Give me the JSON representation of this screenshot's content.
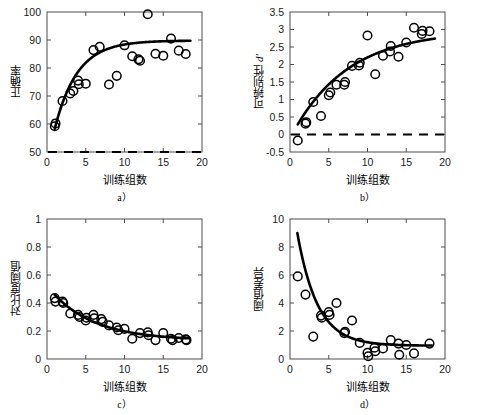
{
  "figure": {
    "xlabel": "训练组数",
    "panels": [
      {
        "id": "a",
        "caption": "a）",
        "ylabel_main": "正确率",
        "ylabel_italic": "",
        "chance_line": 50
      },
      {
        "id": "b",
        "caption": "b）",
        "ylabel_main": "可辨别性 ",
        "ylabel_italic": "d'",
        "chance_line": 0
      },
      {
        "id": "c",
        "caption": "c）",
        "ylabel_main": "对比度阈值",
        "ylabel_italic": "",
        "chance_line": null
      },
      {
        "id": "d",
        "caption": "d）",
        "ylabel_main": "阈值差异",
        "ylabel_italic": "",
        "chance_line": null
      }
    ]
  },
  "chart_data": [
    {
      "type": "scatter",
      "panel": "a",
      "title": "",
      "xlabel": "训练组数",
      "ylabel": "正确率",
      "xlim": [
        0,
        20
      ],
      "ylim": [
        50,
        100
      ],
      "xticks": [
        0,
        5,
        10,
        15,
        20
      ],
      "yticks": [
        50,
        60,
        70,
        80,
        90,
        100
      ],
      "grid": false,
      "legend": "none",
      "marker": "open-circle",
      "x": [
        1,
        1.1,
        2,
        3,
        3.4,
        4,
        4.1,
        5,
        6,
        6.8,
        8,
        9,
        10,
        11,
        11.8,
        12,
        13,
        14,
        15,
        16,
        17,
        17.9
      ],
      "y": [
        59.2,
        60.2,
        68.2,
        70.9,
        71.8,
        75.5,
        74.2,
        74.4,
        86.4,
        87.6,
        74.1,
        77.2,
        88.1,
        84.2,
        83.1,
        82.6,
        99.2,
        85.1,
        84.4,
        90.5,
        86.2,
        85.0
      ],
      "fit_curve": {
        "form": "exponential-rise",
        "description": "y = 89.8 - 31.5*exp(-(x-1)/2.9)",
        "asymptote": 89.8,
        "amplitude": 31.5,
        "tau": 2.9,
        "x_start": 1,
        "x_end": 18.5
      },
      "reference_line": {
        "y": 50,
        "style": "dashed",
        "label": "chance"
      }
    },
    {
      "type": "scatter",
      "panel": "b",
      "title": "",
      "xlabel": "训练组数",
      "ylabel": "可辨别性 d'",
      "xlim": [
        0,
        20
      ],
      "ylim": [
        -0.5,
        3.5
      ],
      "xticks": [
        0,
        5,
        10,
        15,
        20
      ],
      "yticks": [
        -0.5,
        0,
        0.5,
        1,
        1.5,
        2,
        2.5,
        3,
        3.5
      ],
      "grid": false,
      "legend": "none",
      "marker": "open-circle",
      "x": [
        1,
        2,
        2.1,
        3,
        4,
        5,
        5.2,
        6,
        7,
        7.1,
        8,
        8.9,
        9,
        10,
        11,
        12,
        12.9,
        13,
        14,
        15,
        16,
        17,
        17.1,
        18
      ],
      "y": [
        -0.17,
        0.31,
        0.35,
        0.93,
        0.53,
        1.12,
        1.2,
        1.42,
        1.42,
        1.5,
        1.96,
        1.97,
        2.05,
        2.83,
        1.72,
        2.25,
        2.37,
        2.53,
        2.22,
        2.63,
        3.05,
        2.87,
        2.96,
        2.95
      ],
      "fit_curve": {
        "form": "saturating",
        "description": "y = 3.35*(1 - exp(-(x+0.6)/7.2)) - 0.38",
        "x_start": 1,
        "x_end": 18.7
      },
      "reference_line": {
        "y": 0,
        "style": "dashed",
        "label": "zero"
      }
    },
    {
      "type": "scatter",
      "panel": "c",
      "title": "",
      "xlabel": "训练组数",
      "ylabel": "对比度阈值",
      "xlim": [
        0,
        20
      ],
      "ylim": [
        0,
        1
      ],
      "xticks": [
        0,
        5,
        10,
        15,
        20
      ],
      "yticks": [
        0,
        0.2,
        0.4,
        0.6,
        0.8,
        1
      ],
      "grid": false,
      "legend": "none",
      "marker": "open-circle",
      "x": [
        1,
        1.1,
        2,
        2.1,
        3,
        4,
        4.2,
        5,
        5.1,
        6,
        6.1,
        7,
        7.2,
        8,
        9,
        9.2,
        10,
        11,
        12,
        13,
        13.1,
        14,
        15,
        16,
        16.2,
        17,
        17.9,
        18
      ],
      "y": [
        0.435,
        0.41,
        0.41,
        0.4,
        0.325,
        0.315,
        0.3,
        0.275,
        0.295,
        0.315,
        0.29,
        0.285,
        0.265,
        0.24,
        0.225,
        0.205,
        0.215,
        0.145,
        0.185,
        0.19,
        0.17,
        0.135,
        0.185,
        0.145,
        0.135,
        0.15,
        0.14,
        0.135
      ],
      "fit_curve": {
        "form": "exponential-decay",
        "description": "y = 0.133 + 0.325*exp(-(x-1)/5.6)",
        "asymptote": 0.133,
        "amplitude": 0.325,
        "tau": 5.6,
        "x_start": 1,
        "x_end": 18.4
      },
      "reference_line": null
    },
    {
      "type": "scatter",
      "panel": "d",
      "title": "",
      "xlabel": "训练组数",
      "ylabel": "阈值差异",
      "xlim": [
        0,
        20
      ],
      "ylim": [
        0,
        10
      ],
      "xticks": [
        0,
        5,
        10,
        15,
        20
      ],
      "yticks": [
        0,
        2,
        4,
        6,
        8,
        10
      ],
      "grid": false,
      "legend": "none",
      "marker": "open-circle",
      "x": [
        1,
        2,
        3,
        4,
        4.1,
        5,
        5.1,
        6,
        7,
        7.1,
        8,
        9,
        10,
        10.1,
        10.9,
        11,
        12,
        13,
        14,
        14.1,
        15,
        16,
        18
      ],
      "y": [
        5.9,
        4.6,
        1.6,
        3.1,
        2.95,
        3.35,
        3.15,
        4.0,
        1.85,
        1.95,
        2.75,
        1.15,
        0.45,
        0.2,
        0.8,
        0.55,
        0.75,
        1.35,
        1.1,
        0.3,
        1.0,
        0.4,
        1.1
      ],
      "fit_curve": {
        "form": "exponential-decay",
        "description": "y = 0.95 + 9.2*exp(-(x-0.6)/2.6)",
        "asymptote": 0.95,
        "amplitude": 9.2,
        "tau": 2.6,
        "x_start": 0.95,
        "x_end": 18.3
      },
      "reference_line": null
    }
  ]
}
